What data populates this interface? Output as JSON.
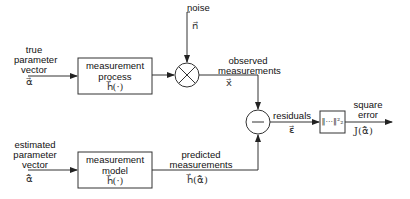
{
  "diagram": {
    "inputs": {
      "true_param": {
        "label": "true\nparameter\nvector",
        "line1": "true",
        "line2": "parameter",
        "line3": "vector",
        "symbol": "α⃗"
      },
      "est_param": {
        "line1": "estimated",
        "line2": "parameter",
        "line3": "vector",
        "symbol": "α̂⃗"
      }
    },
    "blocks": {
      "process": {
        "line1": "measurement",
        "line2": "process",
        "func": "h⃗(·)"
      },
      "model": {
        "line1": "measurement",
        "line2": "model",
        "func": "h⃗(·)"
      },
      "norm": {
        "symbol": "‖···‖²₂"
      }
    },
    "operators": {
      "multiply": {
        "symbol": "×"
      },
      "subtract": {
        "symbol": "−"
      }
    },
    "signals": {
      "noise": {
        "label": "noise",
        "symbol": "n⃗"
      },
      "observed": {
        "line1": "observed",
        "line2": "measurements",
        "symbol": "x⃗"
      },
      "predicted": {
        "line1": "predicted",
        "line2": "measurements",
        "symbol": "h⃗(α̂⃗)"
      },
      "residuals": {
        "label": "residuals",
        "symbol": "ε⃗"
      },
      "square_error": {
        "line1": "square",
        "line2": "error",
        "symbol": "J(α̂⃗)"
      }
    },
    "colors": {
      "stroke": "#333333",
      "background": "#ffffff"
    }
  }
}
